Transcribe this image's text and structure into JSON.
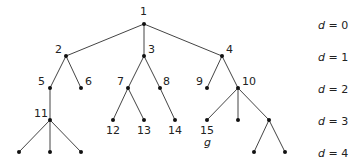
{
  "diagram": {
    "type": "rooted-tree",
    "line_color": "#444444",
    "node_color": "#111111",
    "nodes": [
      {
        "id": "1",
        "label": "1",
        "x": 144,
        "y": 24,
        "lx": 140,
        "ly": 6
      },
      {
        "id": "2",
        "label": "2",
        "x": 66,
        "y": 56,
        "lx": 55,
        "ly": 44
      },
      {
        "id": "3",
        "label": "3",
        "x": 144,
        "y": 56,
        "lx": 148,
        "ly": 44
      },
      {
        "id": "4",
        "label": "4",
        "x": 222,
        "y": 56,
        "lx": 226,
        "ly": 44
      },
      {
        "id": "5",
        "label": "5",
        "x": 50,
        "y": 88,
        "lx": 38,
        "ly": 76
      },
      {
        "id": "6",
        "label": "6",
        "x": 81,
        "y": 88,
        "lx": 85,
        "ly": 76
      },
      {
        "id": "7",
        "label": "7",
        "x": 128,
        "y": 88,
        "lx": 117,
        "ly": 76
      },
      {
        "id": "8",
        "label": "8",
        "x": 160,
        "y": 88,
        "lx": 163,
        "ly": 76
      },
      {
        "id": "9",
        "label": "9",
        "x": 207,
        "y": 88,
        "lx": 196,
        "ly": 76
      },
      {
        "id": "10",
        "label": "10",
        "x": 238,
        "y": 88,
        "lx": 242,
        "ly": 76
      },
      {
        "id": "11",
        "label": "11",
        "x": 50,
        "y": 120,
        "lx": 34,
        "ly": 108
      },
      {
        "id": "12",
        "label": "12",
        "x": 113,
        "y": 120,
        "lx": 106,
        "ly": 125
      },
      {
        "id": "13",
        "label": "13",
        "x": 144,
        "y": 120,
        "lx": 137,
        "ly": 125
      },
      {
        "id": "14",
        "label": "14",
        "x": 175,
        "y": 120,
        "lx": 168,
        "ly": 125
      },
      {
        "id": "15",
        "label": "15",
        "x": 207,
        "y": 120,
        "lx": 200,
        "ly": 125
      },
      {
        "id": "n16",
        "label": "",
        "x": 238,
        "y": 120
      },
      {
        "id": "n17",
        "label": "",
        "x": 269,
        "y": 120
      },
      {
        "id": "n18",
        "label": "",
        "x": 19,
        "y": 152
      },
      {
        "id": "n19",
        "label": "",
        "x": 50,
        "y": 152
      },
      {
        "id": "n20",
        "label": "",
        "x": 81,
        "y": 152
      },
      {
        "id": "n21",
        "label": "",
        "x": 254,
        "y": 152
      },
      {
        "id": "n22",
        "label": "",
        "x": 285,
        "y": 152
      }
    ],
    "edges": [
      [
        "1",
        "2"
      ],
      [
        "1",
        "3"
      ],
      [
        "1",
        "4"
      ],
      [
        "2",
        "5"
      ],
      [
        "2",
        "6"
      ],
      [
        "3",
        "7"
      ],
      [
        "3",
        "8"
      ],
      [
        "4",
        "9"
      ],
      [
        "4",
        "10"
      ],
      [
        "5",
        "11"
      ],
      [
        "7",
        "12"
      ],
      [
        "7",
        "13"
      ],
      [
        "8",
        "14"
      ],
      [
        "10",
        "15"
      ],
      [
        "10",
        "n16"
      ],
      [
        "10",
        "n17"
      ],
      [
        "11",
        "n18"
      ],
      [
        "11",
        "n19"
      ],
      [
        "11",
        "n20"
      ],
      [
        "n17",
        "n21"
      ],
      [
        "n17",
        "n22"
      ]
    ],
    "goal_annotation": {
      "text": "g",
      "node": "15",
      "x": 204,
      "y": 137
    },
    "depth_labels": [
      {
        "var": "d",
        "eq": " = 0",
        "y": 20
      },
      {
        "var": "d",
        "eq": " = 1",
        "y": 52
      },
      {
        "var": "d",
        "eq": " = 2",
        "y": 84
      },
      {
        "var": "d",
        "eq": " = 3",
        "y": 116
      },
      {
        "var": "d",
        "eq": " = 4",
        "y": 148
      }
    ]
  }
}
